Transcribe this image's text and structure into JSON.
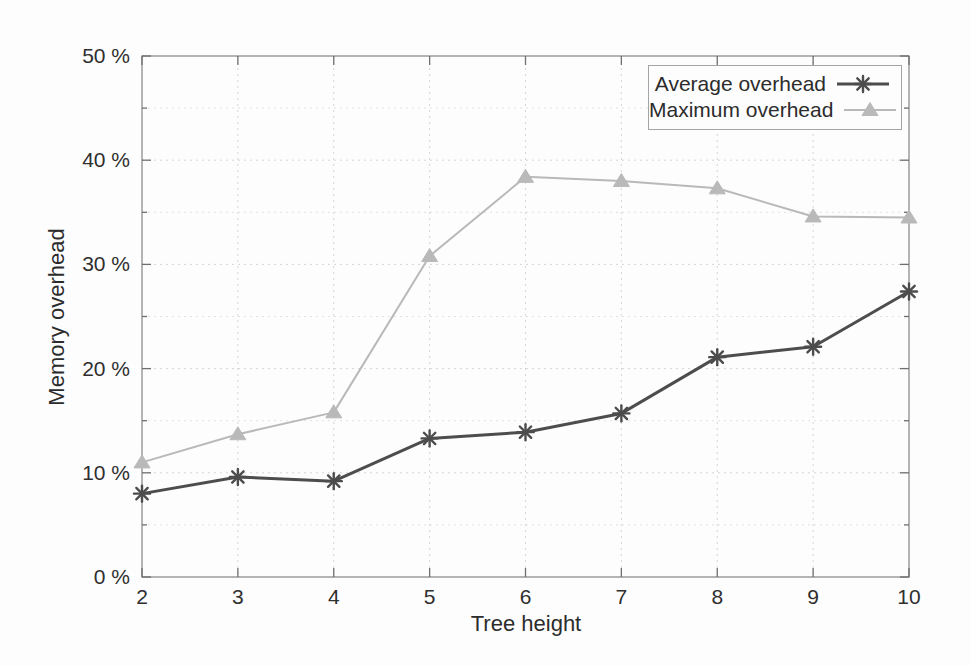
{
  "figure": {
    "background": "#fdfdfd",
    "text_color": "#2f2f2f",
    "axis_color": "#8e8e8e",
    "tick_color": "#6f6f6f",
    "grid_major_color": "#d5d5d5",
    "grid_minor_color": "#e2e2e2",
    "plot_area": {
      "left": 142,
      "right": 909,
      "top": 56,
      "bottom": 577
    }
  },
  "chart_data": {
    "type": "line",
    "title": "",
    "xlabel": "Tree height",
    "ylabel": "Memory overhead",
    "xlim": [
      2,
      10
    ],
    "ylim": [
      0,
      50
    ],
    "x": [
      2,
      3,
      4,
      5,
      6,
      7,
      8,
      9,
      10
    ],
    "xticks": [
      {
        "value": 2,
        "label": "2"
      },
      {
        "value": 3,
        "label": "3"
      },
      {
        "value": 4,
        "label": "4"
      },
      {
        "value": 5,
        "label": "5"
      },
      {
        "value": 6,
        "label": "6"
      },
      {
        "value": 7,
        "label": "7"
      },
      {
        "value": 8,
        "label": "8"
      },
      {
        "value": 9,
        "label": "9"
      },
      {
        "value": 10,
        "label": "10"
      }
    ],
    "yticks": [
      {
        "value": 0,
        "label": "0 %"
      },
      {
        "value": 10,
        "label": "10 %"
      },
      {
        "value": 20,
        "label": "20 %"
      },
      {
        "value": 30,
        "label": "30 %"
      },
      {
        "value": 40,
        "label": "40 %"
      },
      {
        "value": 50,
        "label": "50 %"
      }
    ],
    "minor_ytick_step": 5,
    "grid": "dotted",
    "legend_position": "top-right",
    "series": [
      {
        "name": "Average overhead",
        "marker": "asterisk",
        "color": "#4d4d4d",
        "line_width": 3,
        "values": [
          8.0,
          9.6,
          9.2,
          13.3,
          13.9,
          15.7,
          21.1,
          22.1,
          27.4
        ]
      },
      {
        "name": "Maximum overhead",
        "marker": "triangle-filled",
        "color": "#b9b9b9",
        "line_width": 2,
        "values": [
          11.0,
          13.7,
          15.8,
          30.8,
          38.4,
          38.0,
          37.3,
          34.6,
          34.5
        ]
      }
    ]
  }
}
